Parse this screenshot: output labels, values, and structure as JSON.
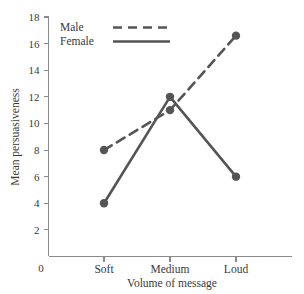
{
  "chart_data": {
    "type": "line",
    "title": "",
    "subtitle": "",
    "xlabel": "Volume of message",
    "ylabel": "Mean persuasiveness",
    "categories": [
      "Soft",
      "Medium",
      "Loud"
    ],
    "origin_label": "0",
    "ylim": [
      0,
      18
    ],
    "ytick_step": 2,
    "ytick_labels": [
      "2",
      "4",
      "6",
      "8",
      "10",
      "12",
      "14",
      "16",
      "18"
    ],
    "ytick_values": [
      2,
      4,
      6,
      8,
      10,
      12,
      14,
      16,
      18
    ],
    "grid": false,
    "legend_position": "top-left-inside",
    "series": [
      {
        "name": "Male",
        "style": "dashed",
        "color": "#555555",
        "marker": "filled-circle",
        "values": [
          8,
          11,
          16.6
        ]
      },
      {
        "name": "Female",
        "style": "solid",
        "color": "#555555",
        "marker": "filled-circle",
        "values": [
          4,
          12,
          6
        ]
      }
    ],
    "axis_color": "#8a8a8a",
    "text_color": "#3a3a3a"
  },
  "legend": {
    "entries": [
      {
        "label": "Male"
      },
      {
        "label": "Female"
      }
    ]
  },
  "axes": {
    "y_title": "Mean persuasiveness",
    "x_title": "Volume of message",
    "origin": "0"
  }
}
